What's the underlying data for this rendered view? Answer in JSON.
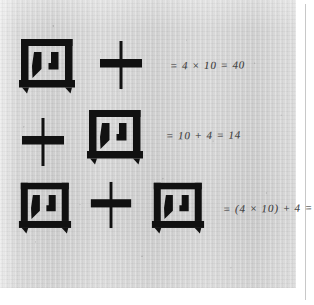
{
  "page": {
    "kind": "scanned-textbook-page",
    "background_color": "#d2d2d2",
    "ink_color": "#111111",
    "handwriting_color": "#3b3b3b"
  },
  "rows": [
    {
      "id": "row-1",
      "glyphs": [
        {
          "char": "四",
          "name": "character-si-four",
          "reading": "si",
          "value": "4"
        },
        {
          "char": "十",
          "name": "character-shi-ten",
          "reading": "shi",
          "value": "10"
        }
      ],
      "expression": "四十",
      "annotation": "= 4 × 10 = 40",
      "result": "40"
    },
    {
      "id": "row-2",
      "glyphs": [
        {
          "char": "十",
          "name": "character-shi-ten",
          "reading": "shi",
          "value": "10"
        },
        {
          "char": "四",
          "name": "character-si-four",
          "reading": "si",
          "value": "4"
        }
      ],
      "expression": "十四",
      "annotation": "= 10 + 4 = 14",
      "result": "14"
    },
    {
      "id": "row-3",
      "glyphs": [
        {
          "char": "四",
          "name": "character-si-four",
          "reading": "si",
          "value": "4"
        },
        {
          "char": "十",
          "name": "character-shi-ten",
          "reading": "shi",
          "value": "10"
        },
        {
          "char": "四",
          "name": "character-si-four",
          "reading": "si",
          "value": "4"
        }
      ],
      "expression": "四十四",
      "annotation": "= (4 × 10) + 4 = 44",
      "result": "44"
    }
  ]
}
